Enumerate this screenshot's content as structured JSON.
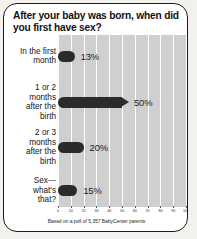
{
  "card": {
    "title": "After your baby was born, when did you first have sex?",
    "footnote": "Based on a poll of 5,357 BabyCenter parents"
  },
  "colors": {
    "bar": "#2b2b2b",
    "plot_background": "#cfcfcf",
    "gridline": "#ffffff",
    "card_background": "#ffffff",
    "border": "#1b1b1b",
    "page_background": "#f2f1ed"
  },
  "chart_data": {
    "type": "bar",
    "orientation": "horizontal",
    "title": "After your baby was born, when did you first have sex?",
    "categories": [
      "In the first month",
      "1 or 2 months after the birth",
      "2 or 3 months after the birth",
      "Sex—what's that?"
    ],
    "category_lines": [
      [
        "In the first",
        "month"
      ],
      [
        "1 or 2",
        "months",
        "after the",
        "birth"
      ],
      [
        "2 or 3",
        "months",
        "after the",
        "birth"
      ],
      [
        "Sex—",
        "what's",
        "that?"
      ]
    ],
    "values": [
      13,
      50,
      20,
      15
    ],
    "value_labels": [
      "13%",
      "50%",
      "20%",
      "15%"
    ],
    "xlabel": "",
    "ylabel": "",
    "xlim": [
      0,
      100
    ],
    "xticks": [
      0,
      10,
      20,
      30,
      40,
      50,
      60,
      70,
      80,
      90,
      100
    ],
    "xtick_labels": [
      "0",
      "10",
      "20",
      "30",
      "40",
      "50",
      "60",
      "70",
      "80",
      "90",
      "100"
    ],
    "grid": true,
    "legend": false,
    "annotation": "Based on a poll of 5,357 BabyCenter parents"
  }
}
